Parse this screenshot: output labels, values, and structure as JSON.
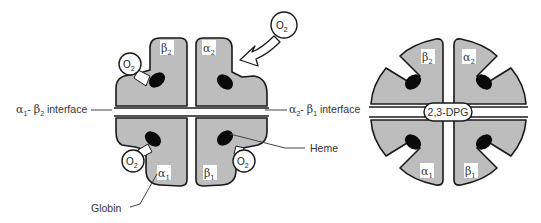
{
  "figure": {
    "left_panel": {
      "subunits": [
        {
          "id": "beta2",
          "greek": "β",
          "index": "2"
        },
        {
          "id": "alpha2",
          "greek": "α",
          "index": "2"
        },
        {
          "id": "alpha1",
          "greek": "α",
          "index": "1"
        },
        {
          "id": "beta1",
          "greek": "β",
          "index": "1"
        }
      ],
      "oxygen_label": "O",
      "oxygen_subscript": "2",
      "annotations": {
        "left_interface": {
          "a": "α",
          "a_sub": "1",
          "sep": "- ",
          "b": "β",
          "b_sub": "2",
          "text": " interface"
        },
        "right_interface": {
          "a": "α",
          "a_sub": "2",
          "sep": "- ",
          "b": "β",
          "b_sub": "1",
          "text": " interface"
        },
        "heme": "Heme",
        "globin": "Globin"
      }
    },
    "right_panel": {
      "subunits": [
        {
          "id": "beta2",
          "greek": "β",
          "index": "2"
        },
        {
          "id": "alpha2",
          "greek": "α",
          "index": "2"
        },
        {
          "id": "alpha1",
          "greek": "α",
          "index": "1"
        },
        {
          "id": "beta1",
          "greek": "β",
          "index": "1"
        }
      ],
      "center_label": "2,3-DPG"
    },
    "colors": {
      "subunit_fill": "#bdbdbd",
      "outline": "#1a1a1a",
      "heme": "#0a0a0a",
      "background": "#ffffff"
    }
  }
}
